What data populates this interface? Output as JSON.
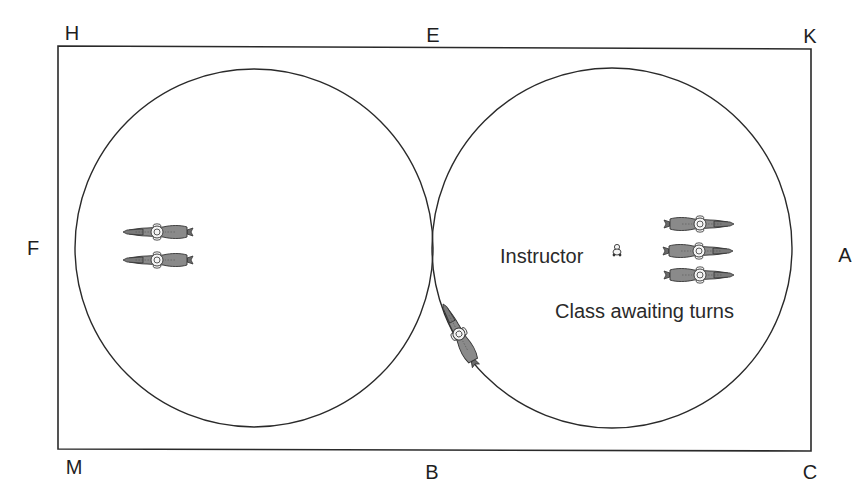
{
  "diagram": {
    "type": "riding-arena-figure-of-eight-circles",
    "arena": {
      "shape": "rectangle",
      "stroke": "#2a2a2a"
    },
    "markers": {
      "top_left": "H",
      "top_center": "E",
      "top_right": "K",
      "left_center": "F",
      "right_center": "A",
      "bottom_left": "M",
      "bottom_center": "B",
      "bottom_right": "C"
    },
    "circles": [
      {
        "name": "left-circle",
        "riders": 2
      },
      {
        "name": "right-circle",
        "riders": 3
      }
    ],
    "labels": {
      "instructor": "Instructor",
      "class": "Class awaiting turns"
    },
    "riders": {
      "left_circle_count": 2,
      "class_waiting_count": 3,
      "on_track_count": 1
    },
    "colors": {
      "line": "#2a2a2a",
      "horse_body": "#8a8a8a",
      "rider": "#f4f4f4",
      "background": "#ffffff"
    }
  }
}
